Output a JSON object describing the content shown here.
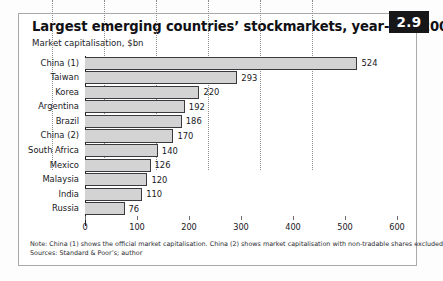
{
  "badge": {
    "label": "2.9"
  },
  "header": {
    "title": "Largest emerging countries’ stockmarkets, year-end 2001",
    "subtitle": "Market capitalisation, $bn"
  },
  "footnotes": {
    "note": "Note: China (1) shows the official market capitalisation. China (2) shows market capitalisation with non-tradable shares excluded.",
    "sources": "Sources: Standard & Poor’s; author"
  },
  "colors": {
    "bar_fill": "#d3d3d3",
    "bar_border": "#3a3a3e",
    "badge_bg": "#17171a",
    "badge_text": "#ffffff",
    "frame_border": "#a9a9a9",
    "gridline": "#8d8d8d",
    "accent_block": "#9a9a9a"
  },
  "chart_data": {
    "type": "bar",
    "orientation": "horizontal",
    "title": "Largest emerging countries’ stockmarkets, year-end 2001",
    "subtitle": "Market capitalisation, $bn",
    "xlabel": "",
    "ylabel": "",
    "xlim": [
      0,
      600
    ],
    "xticks": [
      0,
      100,
      200,
      300,
      400,
      500,
      600
    ],
    "xtick_labels": [
      "0",
      "100",
      "200",
      "300",
      "400",
      "500",
      "600"
    ],
    "grid": "vertical-dotted",
    "legend": "none",
    "categories": [
      "China (1)",
      "Taiwan",
      "Korea",
      "Argentina",
      "Brazil",
      "China (2)",
      "South Africa",
      "Mexico",
      "Malaysia",
      "India",
      "Russia"
    ],
    "values": [
      524,
      293,
      220,
      192,
      186,
      170,
      140,
      126,
      120,
      110,
      76
    ],
    "data_labels": [
      "524",
      "293",
      "220",
      "192",
      "186",
      "170",
      "140",
      "126",
      "120",
      "110",
      "76"
    ]
  }
}
